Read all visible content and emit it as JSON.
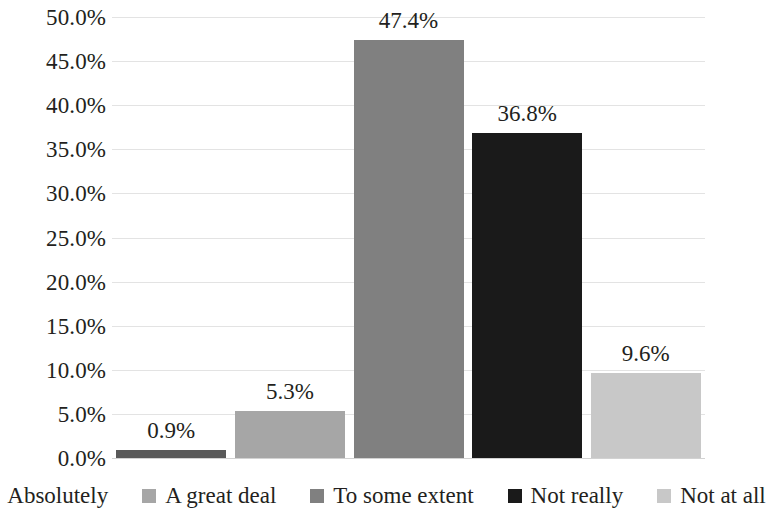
{
  "chart_data": {
    "type": "bar",
    "title": "",
    "subtitle": "",
    "xlabel": "",
    "ylabel": "",
    "categories": [
      "Absolutely",
      "A great deal",
      "To some extent",
      "Not really",
      "Not at all"
    ],
    "values": [
      0.9,
      5.3,
      47.4,
      36.8,
      9.6
    ],
    "data_labels": [
      "0.9%",
      "5.3%",
      "47.4%",
      "36.8%",
      "9.6%"
    ],
    "series": [
      {
        "name": "",
        "values": [
          0.9,
          5.3,
          47.4,
          36.8,
          9.6
        ]
      }
    ],
    "ylim": [
      0,
      50
    ],
    "y_tick_values": [
      50,
      45,
      40,
      35,
      30,
      25,
      20,
      15,
      10,
      5,
      0
    ],
    "y_tick_labels": [
      "50.0%",
      "45.0%",
      "40.0%",
      "35.0%",
      "30.0%",
      "25.0%",
      "20.0%",
      "15.0%",
      "10.0%",
      "5.0%",
      "0.0%"
    ],
    "grid": true,
    "grid_axis": "y",
    "legend_position": "bottom",
    "bar_colors": [
      "#595959",
      "#a6a6a6",
      "#808080",
      "#1a1a1a",
      "#c8c8c8"
    ],
    "colors": {
      "background": "#ffffff",
      "text": "#231f20",
      "gridline": "#e3e3e3",
      "baseline": "#d2d2d2"
    }
  },
  "legend": {
    "items": [
      {
        "label": "Absolutely",
        "color": "#595959"
      },
      {
        "label": "A great deal",
        "color": "#a6a6a6"
      },
      {
        "label": "To some extent",
        "color": "#808080"
      },
      {
        "label": "Not really",
        "color": "#1a1a1a"
      },
      {
        "label": "Not at all",
        "color": "#c8c8c8"
      }
    ]
  }
}
